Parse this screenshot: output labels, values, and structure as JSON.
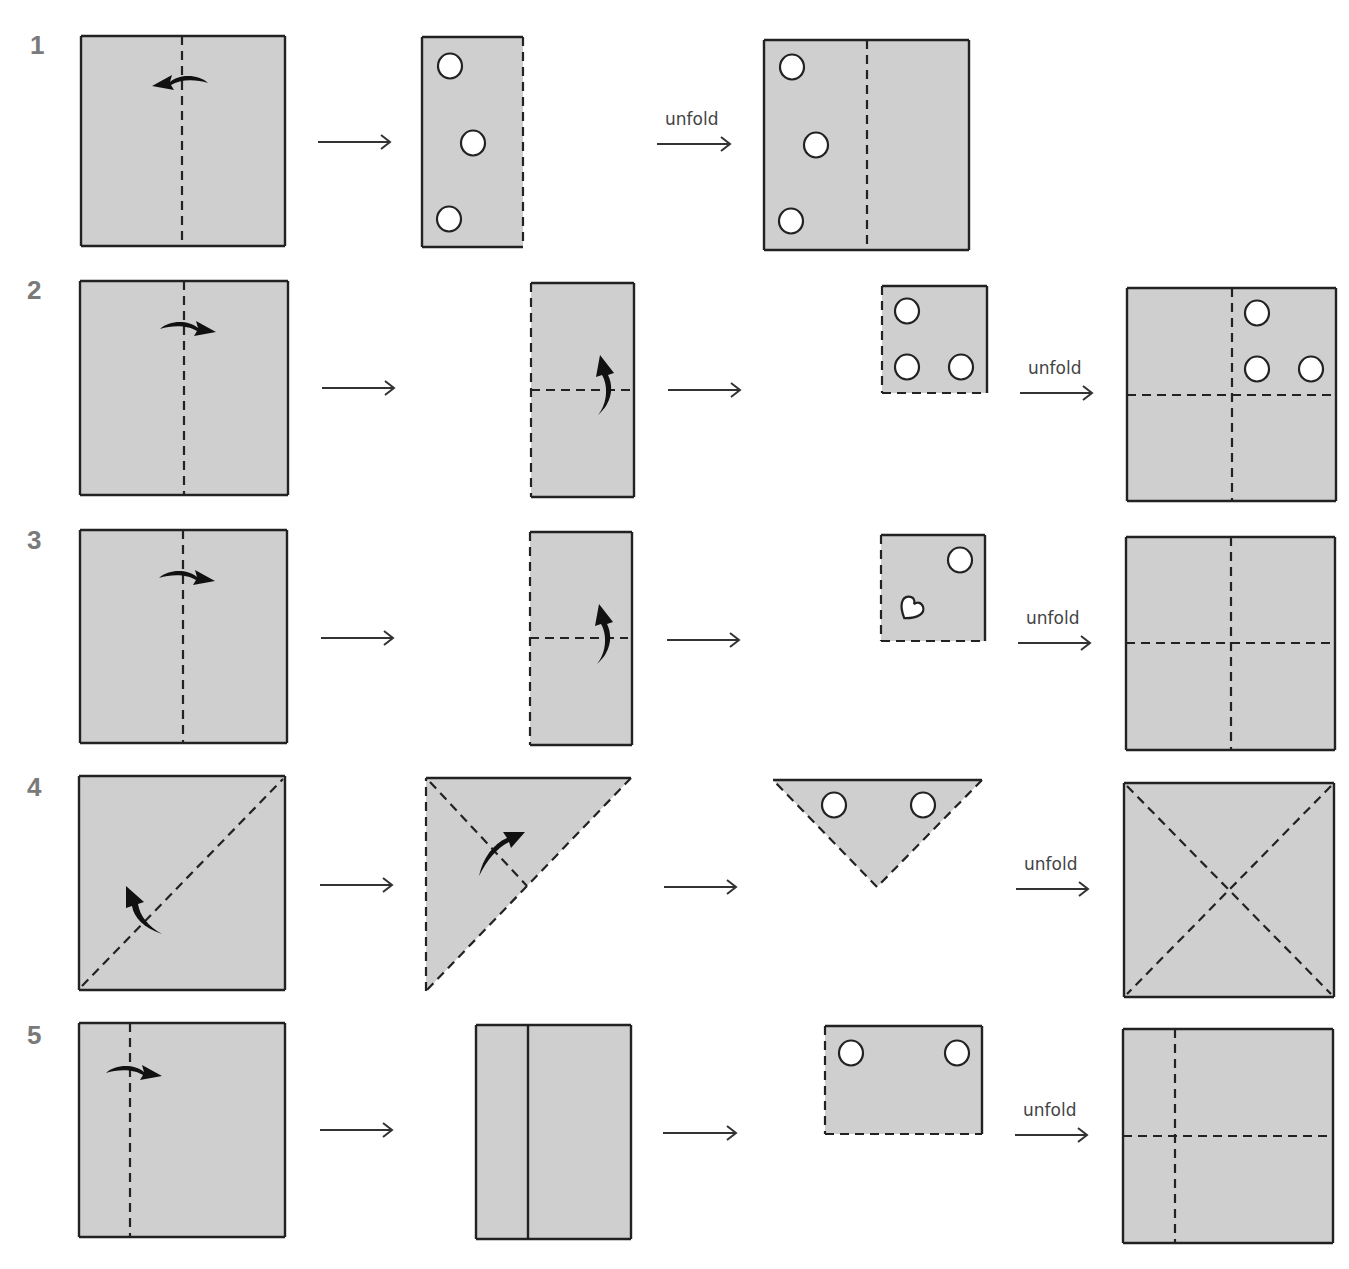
{
  "colors": {
    "paper": "#cfcfcf",
    "outline": "#222222",
    "fold_line": "#222222",
    "hole_fill": "#ffffff",
    "row_number": "#7a7a7a",
    "arrow": "#333333",
    "fold_arrow": "#111111"
  },
  "unfold_label": "unfold",
  "rows": [
    {
      "number": "1",
      "number_pos": [
        30,
        30
      ],
      "shapes": [
        {
          "type": "rect",
          "x": 81,
          "y": 36,
          "w": 204,
          "h": 210,
          "edges": {
            "top": "solid",
            "right": "solid",
            "bottom": "solid",
            "left": "solid"
          },
          "dashes": [
            [
              182,
              36,
              182,
              246
            ]
          ],
          "fold_arrows": [
            {
              "kind": "curve-left",
              "x": 180,
              "y": 80
            }
          ]
        },
        {
          "type": "rect",
          "x": 422,
          "y": 37,
          "w": 101,
          "h": 210,
          "edges": {
            "top": "solid",
            "right": "dashed",
            "bottom": "solid",
            "left": "solid"
          },
          "holes": [
            {
              "shape": "circle",
              "cx": 450,
              "cy": 66
            },
            {
              "shape": "circle",
              "cx": 473,
              "cy": 143
            },
            {
              "shape": "circle",
              "cx": 449,
              "cy": 219
            }
          ]
        },
        {
          "type": "rect",
          "x": 764,
          "y": 40,
          "w": 205,
          "h": 210,
          "edges": {
            "top": "solid",
            "right": "solid",
            "bottom": "solid",
            "left": "solid"
          },
          "dashes": [
            [
              867,
              40,
              867,
              250
            ]
          ],
          "holes": [
            {
              "shape": "circle",
              "cx": 792,
              "cy": 67
            },
            {
              "shape": "circle",
              "cx": 816,
              "cy": 145
            },
            {
              "shape": "circle",
              "cx": 791,
              "cy": 221
            }
          ]
        }
      ],
      "arrows": [
        {
          "x1": 318,
          "x2": 390,
          "y": 142,
          "label": false
        },
        {
          "x1": 657,
          "x2": 730,
          "y": 144,
          "label": true
        }
      ]
    },
    {
      "number": "2",
      "number_pos": [
        27,
        275
      ],
      "shapes": [
        {
          "type": "rect",
          "x": 80,
          "y": 281,
          "w": 208,
          "h": 214,
          "edges": {
            "top": "solid",
            "right": "solid",
            "bottom": "solid",
            "left": "solid"
          },
          "dashes": [
            [
              184,
              281,
              184,
              495
            ]
          ],
          "fold_arrows": [
            {
              "kind": "curve-right",
              "x": 188,
              "y": 326
            }
          ]
        },
        {
          "type": "rect",
          "x": 531,
          "y": 283,
          "w": 103,
          "h": 214,
          "edges": {
            "top": "solid",
            "right": "solid",
            "bottom": "solid",
            "left": "dashed"
          },
          "dashes": [
            [
              531,
              390,
              630,
              390
            ]
          ],
          "fold_arrows": [
            {
              "kind": "curve-up",
              "x": 604,
              "y": 385
            }
          ]
        },
        {
          "type": "rect",
          "x": 882,
          "y": 286,
          "w": 105,
          "h": 107,
          "edges": {
            "top": "solid",
            "right": "solid",
            "bottom": "dashed",
            "left": "dashed"
          },
          "holes": [
            {
              "shape": "circle",
              "cx": 907,
              "cy": 311
            },
            {
              "shape": "circle",
              "cx": 907,
              "cy": 367
            },
            {
              "shape": "circle",
              "cx": 961,
              "cy": 367
            }
          ]
        },
        {
          "type": "rect",
          "x": 1127,
          "y": 288,
          "w": 209,
          "h": 213,
          "edges": {
            "top": "solid",
            "right": "solid",
            "bottom": "solid",
            "left": "solid"
          },
          "dashes": [
            [
              1232,
              288,
              1232,
              501
            ],
            [
              1127,
              395,
              1336,
              395
            ]
          ],
          "holes": [
            {
              "shape": "circle",
              "cx": 1257,
              "cy": 313
            },
            {
              "shape": "circle",
              "cx": 1257,
              "cy": 369
            },
            {
              "shape": "circle",
              "cx": 1311,
              "cy": 369
            }
          ]
        }
      ],
      "arrows": [
        {
          "x1": 322,
          "x2": 394,
          "y": 388,
          "label": false
        },
        {
          "x1": 668,
          "x2": 740,
          "y": 390,
          "label": false
        },
        {
          "x1": 1020,
          "x2": 1092,
          "y": 393,
          "label": true
        }
      ]
    },
    {
      "number": "3",
      "number_pos": [
        27,
        525
      ],
      "shapes": [
        {
          "type": "rect",
          "x": 80,
          "y": 530,
          "w": 207,
          "h": 213,
          "edges": {
            "top": "solid",
            "right": "solid",
            "bottom": "solid",
            "left": "solid"
          },
          "dashes": [
            [
              183,
              530,
              183,
              743
            ]
          ],
          "fold_arrows": [
            {
              "kind": "curve-right",
              "x": 187,
              "y": 575
            }
          ]
        },
        {
          "type": "rect",
          "x": 530,
          "y": 532,
          "w": 102,
          "h": 213,
          "edges": {
            "top": "solid",
            "right": "solid",
            "bottom": "solid",
            "left": "dashed"
          },
          "dashes": [
            [
              530,
              638,
              628,
              638
            ]
          ],
          "fold_arrows": [
            {
              "kind": "curve-up",
              "x": 603,
              "y": 634
            }
          ]
        },
        {
          "type": "rect",
          "x": 881,
          "y": 535,
          "w": 104,
          "h": 106,
          "edges": {
            "top": "solid",
            "right": "solid",
            "bottom": "dashed",
            "left": "dashed"
          },
          "holes": [
            {
              "shape": "circle",
              "cx": 960,
              "cy": 560
            },
            {
              "shape": "heart",
              "cx": 910,
              "cy": 610
            }
          ]
        },
        {
          "type": "rect",
          "x": 1126,
          "y": 537,
          "w": 209,
          "h": 213,
          "edges": {
            "top": "solid",
            "right": "solid",
            "bottom": "solid",
            "left": "solid"
          },
          "dashes": [
            [
              1231,
              537,
              1231,
              750
            ],
            [
              1126,
              643,
              1335,
              643
            ]
          ],
          "holes": []
        }
      ],
      "arrows": [
        {
          "x1": 321,
          "x2": 393,
          "y": 638,
          "label": false
        },
        {
          "x1": 667,
          "x2": 739,
          "y": 640,
          "label": false
        },
        {
          "x1": 1018,
          "x2": 1090,
          "y": 643,
          "label": true
        }
      ]
    },
    {
      "number": "4",
      "number_pos": [
        27,
        772
      ],
      "shapes": [
        {
          "type": "rect",
          "x": 79,
          "y": 776,
          "w": 206,
          "h": 214,
          "edges": {
            "top": "solid",
            "right": "solid",
            "bottom": "solid",
            "left": "solid"
          },
          "dashes": [
            [
              82,
              986,
              283,
              779
            ]
          ],
          "fold_arrows": [
            {
              "kind": "curve-upleft",
              "x": 140,
              "y": 910
            }
          ]
        },
        {
          "type": "poly",
          "points": [
            [
              426,
              778
            ],
            [
              631,
              778
            ],
            [
              426,
              991
            ]
          ],
          "edge_styles": [
            "solid",
            "dashed",
            "dashed"
          ],
          "dashes": [
            [
              430,
              782,
              527,
              886
            ]
          ],
          "fold_arrows": [
            {
              "kind": "curve-upright",
              "x": 497,
              "y": 850
            }
          ]
        },
        {
          "type": "poly",
          "points": [
            [
              773,
              780
            ],
            [
              982,
              780
            ],
            [
              877,
              887
            ]
          ],
          "edge_styles": [
            "solid",
            "dashed",
            "dashed"
          ],
          "holes": [
            {
              "shape": "circle",
              "cx": 834,
              "cy": 805
            },
            {
              "shape": "circle",
              "cx": 923,
              "cy": 805
            }
          ]
        },
        {
          "type": "rect",
          "x": 1124,
          "y": 783,
          "w": 210,
          "h": 214,
          "edges": {
            "top": "solid",
            "right": "solid",
            "bottom": "solid",
            "left": "solid"
          },
          "dashes": [
            [
              1127,
              786,
              1331,
              994
            ],
            [
              1331,
              786,
              1127,
              994
            ]
          ],
          "holes": []
        }
      ],
      "arrows": [
        {
          "x1": 320,
          "x2": 392,
          "y": 885,
          "label": false
        },
        {
          "x1": 664,
          "x2": 736,
          "y": 887,
          "label": false
        },
        {
          "x1": 1016,
          "x2": 1088,
          "y": 889,
          "label": true
        }
      ]
    },
    {
      "number": "5",
      "number_pos": [
        27,
        1020
      ],
      "shapes": [
        {
          "type": "rect",
          "x": 79,
          "y": 1023,
          "w": 206,
          "h": 214,
          "edges": {
            "top": "solid",
            "right": "solid",
            "bottom": "solid",
            "left": "solid"
          },
          "dashes": [
            [
              130,
              1023,
              130,
              1237
            ]
          ],
          "fold_arrows": [
            {
              "kind": "curve-right",
              "x": 134,
              "y": 1070
            }
          ]
        },
        {
          "type": "rect",
          "x": 476,
          "y": 1025,
          "w": 155,
          "h": 214,
          "edges": {
            "top": "solid",
            "right": "solid",
            "bottom": "solid",
            "left": "solid"
          },
          "solid_lines": [
            [
              528,
              1025,
              528,
              1239
            ]
          ]
        },
        {
          "type": "rect",
          "x": 825,
          "y": 1026,
          "w": 157,
          "h": 108,
          "edges": {
            "top": "solid",
            "right": "solid",
            "bottom": "dashed",
            "left": "dashed"
          },
          "holes": [
            {
              "shape": "circle",
              "cx": 851,
              "cy": 1053
            },
            {
              "shape": "circle",
              "cx": 957,
              "cy": 1053
            }
          ]
        },
        {
          "type": "rect",
          "x": 1123,
          "y": 1029,
          "w": 210,
          "h": 214,
          "edges": {
            "top": "solid",
            "right": "solid",
            "bottom": "solid",
            "left": "solid"
          },
          "dashes": [
            [
              1175,
              1029,
              1175,
              1243
            ],
            [
              1123,
              1136,
              1333,
              1136
            ]
          ],
          "holes": []
        }
      ],
      "arrows": [
        {
          "x1": 320,
          "x2": 392,
          "y": 1130,
          "label": false
        },
        {
          "x1": 663,
          "x2": 736,
          "y": 1133,
          "label": false
        },
        {
          "x1": 1015,
          "x2": 1087,
          "y": 1135,
          "label": true
        }
      ]
    }
  ]
}
